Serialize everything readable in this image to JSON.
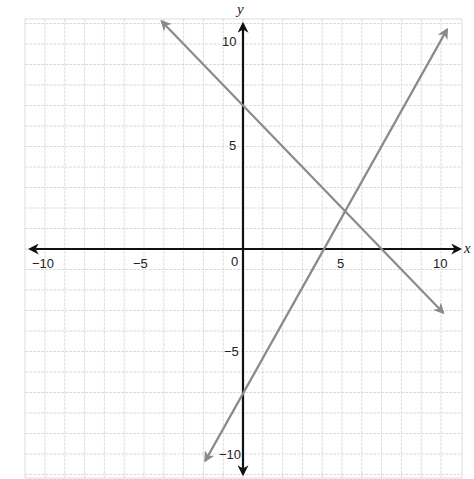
{
  "chart_data": {
    "type": "line",
    "title": "",
    "xlabel": "x",
    "ylabel": "y",
    "xlim": [
      -10,
      10
    ],
    "ylim": [
      -10,
      10
    ],
    "grid": true,
    "x_ticks": [
      "-10",
      "-5",
      "0",
      "5",
      "10"
    ],
    "y_ticks": [
      "10",
      "5",
      "-5",
      "-10"
    ],
    "series": [
      {
        "name": "line 1",
        "equation": "y = -x + 7",
        "slope": -1,
        "intercept": 7,
        "color": "#8a8a8a",
        "arrows": "both"
      },
      {
        "name": "line 2",
        "equation": "y = 1.75x - 7",
        "slope": 1.75,
        "intercept": -7,
        "color": "#8a8a8a",
        "arrows": "both"
      }
    ],
    "intersection": [
      5,
      2
    ]
  },
  "labels": {
    "x_axis": "x",
    "y_axis": "y",
    "origin": "0",
    "x_neg10": "−10",
    "x_neg5": "−5",
    "x_5": "5",
    "x_10": "10",
    "y_10": "10",
    "y_5": "5",
    "y_neg5": "−5",
    "y_neg10": "−10"
  }
}
